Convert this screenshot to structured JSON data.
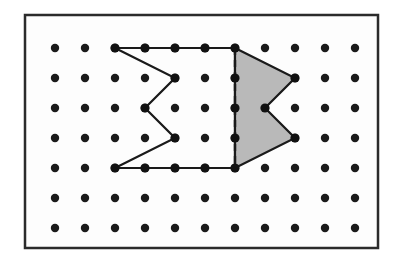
{
  "figure": {
    "type": "geoboard-diagram",
    "canvas": {
      "width": 401,
      "height": 273,
      "background": "#ffffff"
    },
    "frame": {
      "name": "outer-border",
      "x": 25,
      "y": 15,
      "width": 353,
      "height": 233,
      "stroke": "#2b2b2b",
      "stroke_width": 2.5,
      "fill": "#fdfdfd"
    },
    "grid": {
      "name": "peg-grid",
      "columns": 11,
      "rows": 7,
      "spacing_x": 30,
      "spacing_y": 30,
      "origin_x": 55,
      "origin_y": 48,
      "dot_radius": 4.2,
      "dot_color": "#1a1a1a",
      "column_x": [
        55,
        85,
        115,
        145,
        175,
        205,
        235,
        265,
        295,
        325,
        355
      ],
      "row_y": [
        48,
        78,
        108,
        138,
        168,
        198,
        228
      ]
    },
    "shapes": [
      {
        "name": "left-polygon-unshaded",
        "label": "unshaded zigzag polygon",
        "fill": "none",
        "stroke": "#1a1a1a",
        "stroke_width": 2.2,
        "dashed_edges": [],
        "points": "115,48 235,48 235,168 115,168 175,138 145,108 175,78",
        "vertices": [
          [
            115,
            48
          ],
          [
            235,
            48
          ],
          [
            235,
            168
          ],
          [
            115,
            168
          ],
          [
            175,
            138
          ],
          [
            145,
            108
          ],
          [
            175,
            78
          ]
        ]
      },
      {
        "name": "right-polygon-shaded",
        "label": "shaded chevron polygon",
        "fill": "#b9b9b9",
        "stroke": "#1a1a1a",
        "stroke_width": 2.2,
        "points": "235,48 295,78 265,108 295,138 235,168",
        "vertices": [
          [
            235,
            48
          ],
          [
            295,
            78
          ],
          [
            265,
            108
          ],
          [
            295,
            138
          ],
          [
            235,
            168
          ]
        ]
      }
    ],
    "dashed_line": {
      "name": "dashed-divider-line",
      "x1": 235,
      "y1": 48,
      "x2": 235,
      "y2": 168,
      "stroke": "#1a1a1a",
      "stroke_width": 2.4,
      "dash_pattern": "7 5"
    },
    "marked_vertices": [
      [
        115,
        48
      ],
      [
        145,
        48
      ],
      [
        175,
        48
      ],
      [
        205,
        48
      ],
      [
        235,
        48
      ],
      [
        175,
        78
      ],
      [
        235,
        78
      ],
      [
        295,
        78
      ],
      [
        145,
        108
      ],
      [
        235,
        108
      ],
      [
        265,
        108
      ],
      [
        175,
        138
      ],
      [
        235,
        138
      ],
      [
        295,
        138
      ],
      [
        115,
        168
      ],
      [
        145,
        168
      ],
      [
        175,
        168
      ],
      [
        205,
        168
      ],
      [
        235,
        168
      ]
    ],
    "vertex_dot_radius": 4.6,
    "vertex_dot_color": "#111111"
  }
}
